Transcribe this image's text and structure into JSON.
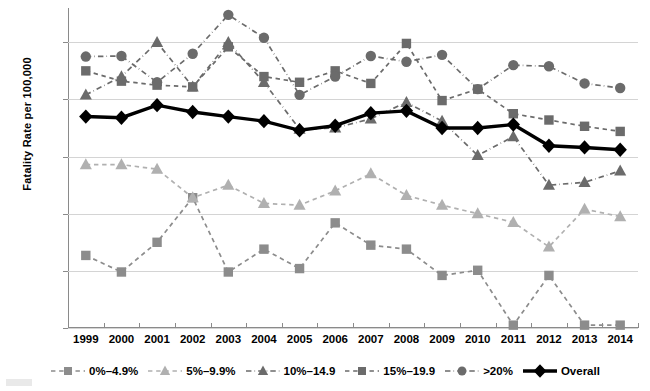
{
  "chart_data": {
    "type": "line",
    "title": "",
    "xlabel": "",
    "ylabel": "Fatality Rate per 100,000",
    "ylim": [
      0,
      5.6
    ],
    "yticks": [
      0,
      1,
      2,
      3,
      4,
      5
    ],
    "grid": true,
    "legend_position": "bottom",
    "categories": [
      "1999",
      "2000",
      "2001",
      "2002",
      "2003",
      "2004",
      "2005",
      "2006",
      "2007",
      "2008",
      "2009",
      "2010",
      "2011",
      "2012",
      "2013",
      "2014"
    ],
    "series": [
      {
        "name": "0%–4.9%",
        "marker": "square",
        "color": "#8c8c8c",
        "linestyle": "dashed",
        "values": [
          1.27,
          0.98,
          1.5,
          2.28,
          0.98,
          1.38,
          1.04,
          1.84,
          1.45,
          1.38,
          0.92,
          1.01,
          0.05,
          0.92,
          0.05,
          0.05
        ]
      },
      {
        "name": "5%–9.9%",
        "marker": "triangle",
        "color": "#b0b0b0",
        "linestyle": "dashed",
        "values": [
          2.86,
          2.86,
          2.78,
          2.28,
          2.5,
          2.18,
          2.15,
          2.4,
          2.7,
          2.32,
          2.15,
          2.0,
          1.85,
          1.42,
          2.08,
          1.95
        ]
      },
      {
        "name": "10%–14.9",
        "marker": "triangle",
        "color": "#6b6b6b",
        "linestyle": "dashdot",
        "values": [
          4.08,
          4.4,
          5.0,
          4.22,
          5.0,
          4.3,
          3.48,
          3.5,
          3.66,
          3.95,
          3.62,
          3.02,
          3.35,
          2.5,
          2.55,
          2.75
        ]
      },
      {
        "name": "15%–19.9",
        "marker": "square",
        "color": "#6b6b6b",
        "linestyle": "dashed",
        "values": [
          4.5,
          4.32,
          4.25,
          4.22,
          4.92,
          4.4,
          4.3,
          4.5,
          4.28,
          4.98,
          3.98,
          4.18,
          3.75,
          3.64,
          3.53,
          3.44
        ]
      },
      {
        "name": ">20%",
        "marker": "circle",
        "color": "#6b6b6b",
        "linestyle": "dashdot",
        "values": [
          4.75,
          4.76,
          4.3,
          4.8,
          5.48,
          5.08,
          4.08,
          4.4,
          4.76,
          4.66,
          4.78,
          4.18,
          4.6,
          4.58,
          4.28,
          4.2
        ]
      },
      {
        "name": "Overall",
        "marker": "diamond",
        "color": "#000000",
        "linestyle": "solid",
        "values": [
          3.7,
          3.68,
          3.9,
          3.78,
          3.7,
          3.62,
          3.46,
          3.54,
          3.76,
          3.8,
          3.5,
          3.5,
          3.56,
          3.19,
          3.16,
          3.12
        ]
      }
    ]
  },
  "legend": {
    "items": [
      {
        "label": "0%–4.9%"
      },
      {
        "label": "5%–9.9%"
      },
      {
        "label": "10%–14.9"
      },
      {
        "label": "15%–19.9"
      },
      {
        "label": ">20%"
      },
      {
        "label": "Overall"
      }
    ]
  },
  "axes": {
    "y_title": "Fatality Rate per 100,000"
  }
}
